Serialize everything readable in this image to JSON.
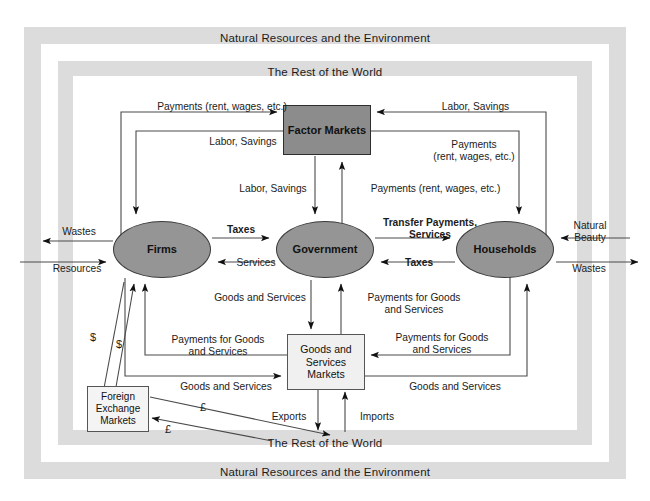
{
  "diagram": {
    "frames": {
      "environment_top": "Natural Resources and the Environment",
      "environment_bottom": "Natural Resources and the Environment",
      "world_top": "The Rest of the World",
      "world_bottom": "The Rest of the World"
    },
    "nodes": {
      "firms": "Firms",
      "government": "Government",
      "households": "Households",
      "factor_markets": "Factor Markets",
      "goods_services_markets": "Goods and\nServices\nMarkets",
      "foreign_exchange_markets": "Foreign\nExchange\nMarkets"
    },
    "colors": {
      "band": "#dcdcdc",
      "ellipse_fill": "#959595",
      "factor_markets_fill": "#8c8c8c",
      "goods_markets_fill": "#f0f0f0",
      "fx_markets_fill": "#f4f4f4",
      "stroke": "#2e2e2e",
      "text": "#1b1b1b"
    },
    "flow_labels": {
      "firms_to_factor_payments": "Payments (rent, wages, etc.)",
      "factor_to_firms_labor": "Labor, Savings",
      "households_to_factor_labor": "Labor, Savings",
      "factor_to_households_payments": "Payments\n(rent, wages, etc.)",
      "factor_to_government_labor": "Labor, Savings",
      "government_to_factor_payments": "Payments (rent, wages, etc.)",
      "firms_to_government_taxes": "Taxes",
      "government_to_firms_services": "Services",
      "government_to_households_transfers": "Transfer Payments,\nServices",
      "households_to_government_taxes": "Taxes",
      "env_wastes_left": "Wastes",
      "env_resources_left": "Resources",
      "env_natural_beauty_right": "Natural\nBeauty",
      "env_wastes_right": "Wastes",
      "government_to_gsm_goods": "Goods and Services",
      "gsm_to_government_payments": "Payments for Goods\nand Services",
      "firms_payments_for_goods": "Payments for Goods\nand Services",
      "firms_goods_and_services": "Goods and Services",
      "households_payments_for_goods_upper": "Payments for Goods\nand Services",
      "households_payments_for_goods_lower": "Payments for Goods\nand Services",
      "households_goods_and_services": "Goods and Services",
      "fx_dollars_out": "$",
      "fx_dollars_in": "$",
      "fx_pounds_out": "£",
      "fx_pounds_in": "£",
      "exports": "Exports",
      "imports": "Imports"
    }
  }
}
